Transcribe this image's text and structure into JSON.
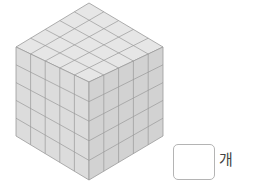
{
  "figure": {
    "type": "isometric-cube-of-unit-cubes",
    "grid": {
      "width": 5,
      "depth": 5,
      "height": 5
    },
    "colors": {
      "top": "#e6e6e6",
      "left": "#dcdcdc",
      "right": "#d2d2d2",
      "lines": "#9a9a9a"
    }
  },
  "answer": {
    "value": "",
    "unit": "개"
  }
}
